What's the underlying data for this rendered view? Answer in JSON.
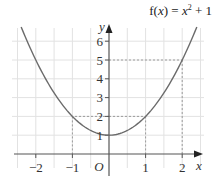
{
  "chart_data": {
    "type": "line",
    "title_parts": {
      "prefix": "f(",
      "var": "x",
      "mid": ") = ",
      "var2": "x",
      "exp": "2",
      "suffix": " + 1"
    },
    "xlabel": "x",
    "ylabel": "y",
    "origin_label": "O",
    "xlim": [
      -2.5,
      2.5
    ],
    "ylim": [
      0,
      7
    ],
    "x_ticks": [
      -2,
      -1,
      1,
      2
    ],
    "x_tick_labels": [
      "−2",
      "−1",
      "1",
      "2"
    ],
    "y_ticks": [
      1,
      2,
      3,
      4,
      5,
      6
    ],
    "y_tick_labels": [
      "1",
      "2",
      "3",
      "4",
      "5",
      "6"
    ],
    "grid": true,
    "grid_x_step": 0.5,
    "grid_y_step": 1,
    "series": [
      {
        "name": "f(x) = x^2 + 1",
        "function": "x^2 + 1",
        "x": [
          -2.4,
          -2,
          -1.5,
          -1,
          -0.5,
          0,
          0.5,
          1,
          1.5,
          2,
          2.4
        ],
        "y": [
          6.76,
          5,
          3.25,
          2,
          1.25,
          1,
          1.25,
          2,
          3.25,
          5,
          6.76
        ]
      }
    ],
    "annotations": [
      {
        "type": "dashed-guide",
        "point": [
          -1,
          2
        ]
      },
      {
        "type": "dashed-guide",
        "point": [
          1,
          2
        ]
      },
      {
        "type": "dashed-guide",
        "point": [
          2,
          5
        ]
      }
    ],
    "colors": {
      "curve": "#6b6b6b",
      "axis": "#555555",
      "grid": "#e2e2e2",
      "guide": "#888888"
    }
  }
}
